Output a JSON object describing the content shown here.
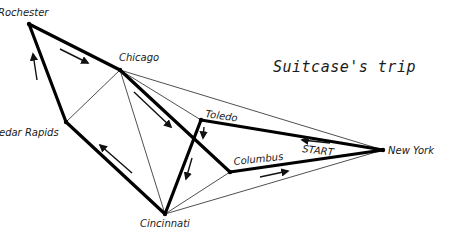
{
  "title": "Suitcase's trip",
  "start_label": "START",
  "cities": [
    {
      "id": "rochester",
      "name": "Rochester",
      "x": 29,
      "y": 24,
      "label_x": -2,
      "label_y": 16
    },
    {
      "id": "chicago",
      "name": "Chicago",
      "x": 120,
      "y": 70,
      "label_x": 119,
      "label_y": 61
    },
    {
      "id": "cedar-rapids",
      "name": "Cedar Rapids",
      "x": 66,
      "y": 122,
      "label_x": -8,
      "label_y": 136
    },
    {
      "id": "toledo",
      "name": "Toledo",
      "x": 201,
      "y": 120,
      "label_x": 205,
      "label_y": 117
    },
    {
      "id": "columbus",
      "name": "Columbus",
      "x": 230,
      "y": 172,
      "label_x": 234,
      "label_y": 165
    },
    {
      "id": "cincinnati",
      "name": "Cincinnati",
      "x": 165,
      "y": 214,
      "label_x": 140,
      "label_y": 227
    },
    {
      "id": "new-york",
      "name": "New York",
      "x": 383,
      "y": 150,
      "label_x": 388,
      "label_y": 154
    }
  ],
  "routes_thick": [
    [
      "rochester",
      "chicago"
    ],
    [
      "rochester",
      "cedar-rapids"
    ],
    [
      "cedar-rapids",
      "cincinnati"
    ],
    [
      "cincinnati",
      "toledo"
    ],
    [
      "toledo",
      "new-york"
    ],
    [
      "chicago",
      "columbus"
    ],
    [
      "columbus",
      "new-york"
    ]
  ],
  "routes_thin": [
    [
      "cedar-rapids",
      "chicago"
    ],
    [
      "chicago",
      "cincinnati"
    ],
    [
      "chicago",
      "toledo"
    ],
    [
      "chicago",
      "new-york"
    ],
    [
      "cincinnati",
      "columbus"
    ],
    [
      "cincinnati",
      "new-york"
    ]
  ],
  "arrows": [
    {
      "from": [
        37,
        80
      ],
      "to": [
        33,
        54
      ]
    },
    {
      "from": [
        60,
        49
      ],
      "to": [
        88,
        63
      ]
    },
    {
      "from": [
        134,
        92
      ],
      "to": [
        171,
        127
      ]
    },
    {
      "from": [
        204,
        127
      ],
      "to": [
        203,
        138
      ]
    },
    {
      "from": [
        192,
        158
      ],
      "to": [
        186,
        179
      ]
    },
    {
      "from": [
        132,
        173
      ],
      "to": [
        100,
        145
      ]
    },
    {
      "from": [
        260,
        177
      ],
      "to": [
        288,
        171
      ]
    },
    {
      "from": [
        330,
        143
      ],
      "to": [
        302,
        140
      ]
    }
  ],
  "colors": {
    "line": "#000000",
    "background": "#ffffff"
  }
}
